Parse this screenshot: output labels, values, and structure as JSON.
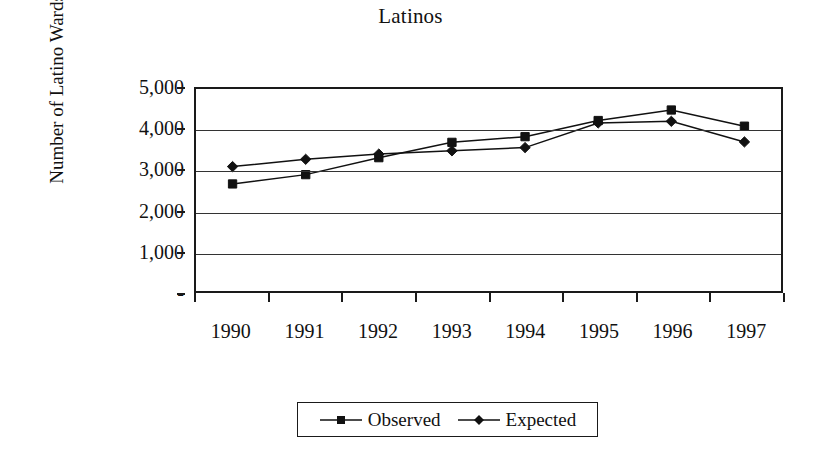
{
  "chart_data": {
    "type": "line",
    "title": "Latinos",
    "xlabel": "",
    "ylabel": "Number of Latino Wards",
    "categories": [
      "1990",
      "1991",
      "1992",
      "1993",
      "1994",
      "1995",
      "1996",
      "1997"
    ],
    "series": [
      {
        "name": "Observed",
        "marker": "square",
        "color": "#111111",
        "values": [
          2650,
          2880,
          3300,
          3680,
          3820,
          4220,
          4480,
          4080
        ]
      },
      {
        "name": "Expected",
        "marker": "diamond",
        "color": "#111111",
        "values": [
          3080,
          3260,
          3390,
          3470,
          3550,
          4160,
          4200,
          3690
        ]
      }
    ],
    "ylim": [
      0,
      5000
    ],
    "ytick_values": [
      5000,
      4000,
      3000,
      2000,
      1000,
      0
    ],
    "ytick_labels": [
      "5,000",
      "4,000",
      "3,000",
      "2,000",
      "1,000",
      "-"
    ],
    "grid": "horizontal",
    "legend_position": "bottom-center",
    "plot_border": true
  },
  "legend": {
    "entries": [
      {
        "label": "Observed",
        "marker": "square-marker-icon"
      },
      {
        "label": "Expected",
        "marker": "diamond-marker-icon"
      }
    ]
  }
}
